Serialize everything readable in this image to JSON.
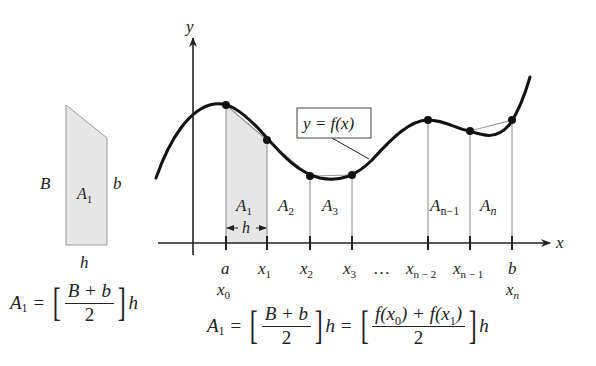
{
  "figure": {
    "trapezoid": {
      "left_side_label": "B",
      "right_side_label": "b",
      "base_label": "h",
      "area_label": "A",
      "area_sub": "1",
      "formula": {
        "lhs": "A",
        "lhs_sub": "1",
        "eq": "=",
        "numerator": "B + b",
        "denominator": "2",
        "trailing": "h"
      }
    },
    "graph": {
      "y_axis_label": "y",
      "x_axis_label": "x",
      "curve_label": "y = f(x)",
      "width_label": "h",
      "area_labels": [
        {
          "base": "A",
          "sub": "1"
        },
        {
          "base": "A",
          "sub": "2"
        },
        {
          "base": "A",
          "sub": "3"
        },
        {
          "base": "A",
          "sub": "n−1"
        },
        {
          "base": "A",
          "sub": "n"
        }
      ],
      "tick_labels": [
        {
          "top": "a",
          "base": "x",
          "sub": "0"
        },
        {
          "base": "x",
          "sub": "1"
        },
        {
          "base": "x",
          "sub": "2"
        },
        {
          "base": "x",
          "sub": "3"
        },
        {
          "ellipsis": "…"
        },
        {
          "base": "x",
          "sub": "n − 2"
        },
        {
          "base": "x",
          "sub": "n − 1"
        },
        {
          "top": "b",
          "base": "x",
          "sub": "n"
        }
      ],
      "formula": {
        "lhs": "A",
        "lhs_sub": "1",
        "eq": "=",
        "numerator1": "B + b",
        "denominator1": "2",
        "trailing1": "h",
        "eq2": "=",
        "numerator2_f0": "f(x",
        "numerator2_f0_sub": "0",
        "numerator2_mid": ") + f(x",
        "numerator2_f1_sub": "1",
        "numerator2_end": ")",
        "denominator2": "2",
        "trailing2": "h"
      }
    },
    "colors": {
      "curve": "#111111",
      "chord": "#9a9a9a",
      "shade": "#e6e6e6",
      "axis": "#222222"
    }
  }
}
